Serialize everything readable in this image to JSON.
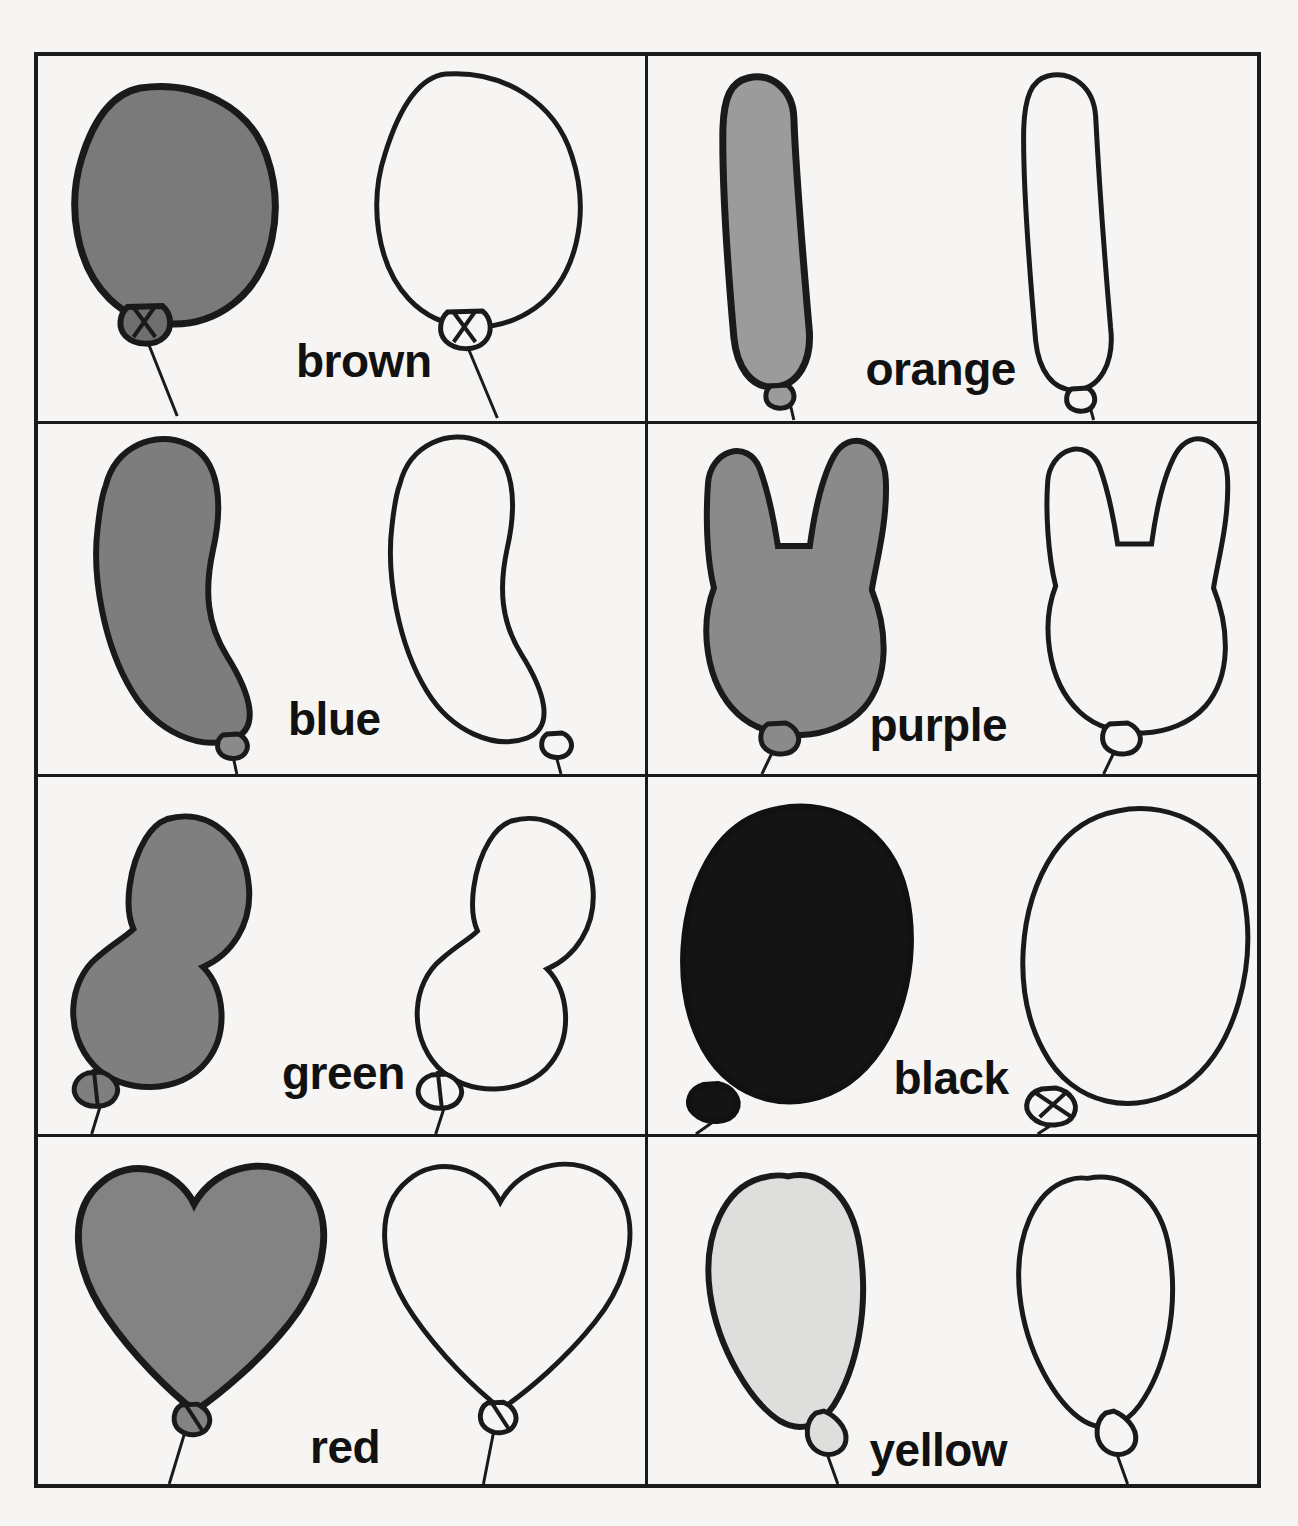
{
  "worksheet": {
    "kind": "color-words-balloon-tracing-worksheet",
    "columns": 2,
    "rows": 4,
    "background_color": "#f6f5f3",
    "line_color": "#1a1a1a"
  },
  "cells": [
    {
      "id": "cell-brown",
      "label": "brown",
      "shape": "round",
      "fill_color": "#7a7a7a",
      "fill_name": "medium-gray",
      "label_left": 258,
      "label_top": 282,
      "row": 1,
      "column": 1
    },
    {
      "id": "cell-orange",
      "label": "orange",
      "shape": "long-tube",
      "fill_color": "#9b9b9b",
      "fill_name": "light-medium-gray",
      "label_left": 218,
      "label_top": 290,
      "row": 1,
      "column": 2
    },
    {
      "id": "cell-blue",
      "label": "blue",
      "shape": "curved-bean",
      "fill_color": "#7d7d7d",
      "fill_name": "medium-gray",
      "label_left": 250,
      "label_top": 272,
      "row": 2,
      "column": 1
    },
    {
      "id": "cell-purple",
      "label": "purple",
      "shape": "bunny-ears",
      "fill_color": "#8a8a8a",
      "fill_name": "medium-gray",
      "label_left": 222,
      "label_top": 278,
      "row": 2,
      "column": 2
    },
    {
      "id": "cell-green",
      "label": "green",
      "shape": "double-bubble",
      "fill_color": "#7f7f7f",
      "fill_name": "medium-gray",
      "label_left": 244,
      "label_top": 273,
      "row": 3,
      "column": 1
    },
    {
      "id": "cell-black",
      "label": "black",
      "shape": "oval",
      "fill_color": "#1a1a1a",
      "fill_name": "black",
      "label_left": 246,
      "label_top": 278,
      "row": 3,
      "column": 2
    },
    {
      "id": "cell-red",
      "label": "red",
      "shape": "heart",
      "fill_color": "#838383",
      "fill_name": "medium-gray",
      "label_left": 272,
      "label_top": 287,
      "row": 4,
      "column": 1
    },
    {
      "id": "cell-yellow",
      "label": "yellow",
      "shape": "teardrop",
      "fill_color": "#dededc",
      "fill_name": "very-light-gray",
      "label_left": 222,
      "label_top": 290,
      "row": 4,
      "column": 2
    }
  ]
}
